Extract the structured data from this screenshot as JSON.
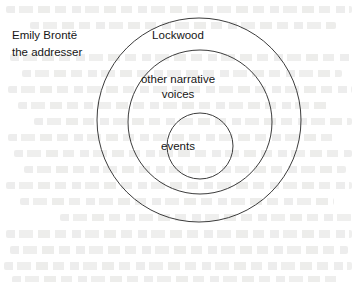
{
  "figure": {
    "type": "concentric-circles-diagram",
    "background_color": "#ffffff",
    "stroke_color": "#3c3c3c",
    "text_color": "#161616",
    "caption": {
      "line1": "Emily Brontë",
      "line2": "the addresser"
    },
    "rings": [
      {
        "id": "outer",
        "label": "Lockwood",
        "cx": 199,
        "cy": 120,
        "r": 102
      },
      {
        "id": "middle",
        "label_line1": "other narrative",
        "label_line2": "voices",
        "cx": 200,
        "cy": 122,
        "r": 72
      },
      {
        "id": "inner",
        "label": "events",
        "cx": 200,
        "cy": 146,
        "r": 33
      }
    ]
  }
}
